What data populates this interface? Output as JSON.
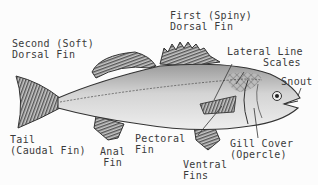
{
  "diagram": {
    "labels": {
      "first_dorsal_line1": "First (Spiny)",
      "first_dorsal_line2": "Dorsal Fin",
      "second_dorsal_line1": "Second (Soft)",
      "second_dorsal_line2": "Dorsal Fin",
      "lateral_line_line1": "Lateral Line",
      "lateral_line_line2": "Scales",
      "snout": "Snout",
      "tail_line1": "Tail",
      "tail_line2": "(Caudal Fin)",
      "anal_line1": "Anal",
      "anal_line2": "Fin",
      "pectoral_line1": "Pectoral",
      "pectoral_line2": "Fin",
      "gill_line1": "Gill Cover",
      "gill_line2": "(Opercle)",
      "ventral_line1": "Ventral",
      "ventral_line2": "Fins"
    },
    "colors": {
      "ink": "#333333",
      "body_fill": "#d9d9d9",
      "fin_fill": "#8a8a8a",
      "background": "#fcfcfc"
    }
  }
}
